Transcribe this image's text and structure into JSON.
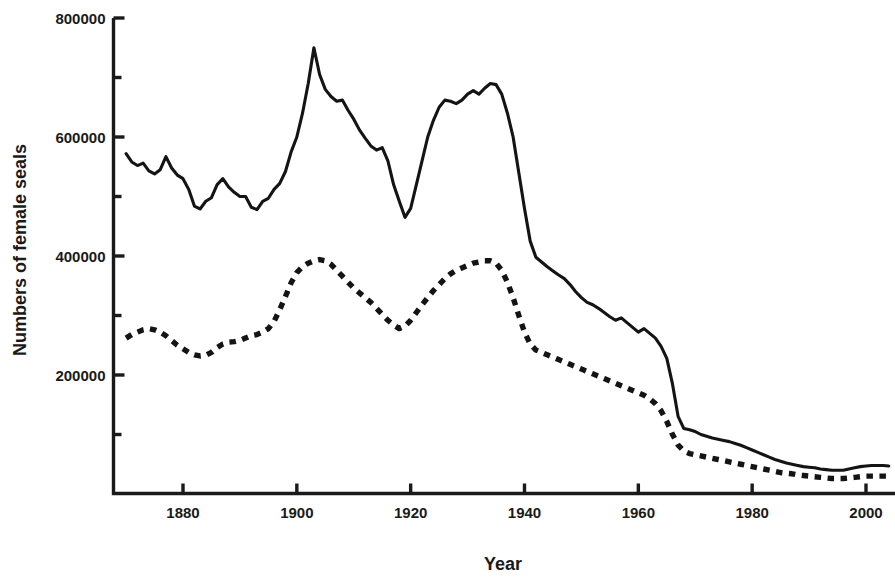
{
  "chart_data": {
    "type": "line",
    "title": "",
    "xlabel": "Year",
    "ylabel": "Numbers of female seals",
    "xlim": [
      1870,
      2005
    ],
    "ylim": [
      0,
      800000
    ],
    "grid": false,
    "legend": "none",
    "x_ticks": [
      1880,
      1900,
      1920,
      1940,
      1960,
      1980,
      2000
    ],
    "x_tick_labels": [
      "1880",
      "1900",
      "1920",
      "1940",
      "1960",
      "1980",
      "2000"
    ],
    "x_minor_ticks": [
      1890,
      1910,
      1930,
      1950,
      1970,
      1990
    ],
    "y_ticks": [
      200000,
      400000,
      600000,
      800000
    ],
    "y_tick_labels": [
      "200000",
      "400000",
      "600000",
      "800000"
    ],
    "y_minor_ticks": [
      100000,
      300000,
      500000,
      700000
    ],
    "series": [
      {
        "name": "solid-line",
        "style": "solid",
        "color": "#141414",
        "x": [
          1870,
          1871,
          1872,
          1873,
          1874,
          1875,
          1876,
          1877,
          1878,
          1879,
          1880,
          1881,
          1882,
          1883,
          1884,
          1885,
          1886,
          1887,
          1888,
          1889,
          1890,
          1891,
          1892,
          1893,
          1894,
          1895,
          1896,
          1897,
          1898,
          1899,
          1900,
          1901,
          1902,
          1903,
          1904,
          1905,
          1906,
          1907,
          1908,
          1909,
          1910,
          1911,
          1912,
          1913,
          1914,
          1915,
          1916,
          1917,
          1918,
          1919,
          1920,
          1921,
          1922,
          1923,
          1924,
          1925,
          1926,
          1927,
          1928,
          1929,
          1930,
          1931,
          1932,
          1933,
          1934,
          1935,
          1936,
          1937,
          1938,
          1939,
          1940,
          1941,
          1942,
          1943,
          1944,
          1945,
          1946,
          1947,
          1948,
          1949,
          1950,
          1951,
          1952,
          1953,
          1954,
          1955,
          1956,
          1957,
          1958,
          1959,
          1960,
          1961,
          1962,
          1963,
          1964,
          1965,
          1966,
          1967,
          1968,
          1969,
          1970,
          1971,
          1972,
          1973,
          1974,
          1975,
          1976,
          1977,
          1978,
          1979,
          1980,
          1981,
          1982,
          1983,
          1984,
          1985,
          1986,
          1987,
          1988,
          1989,
          1990,
          1991,
          1992,
          1993,
          1994,
          1995,
          1996,
          1997,
          1998,
          1999,
          2000,
          2001,
          2002,
          2003,
          2004
        ],
        "y": [
          572000,
          558000,
          552000,
          556000,
          543000,
          538000,
          545000,
          567000,
          548000,
          536000,
          530000,
          512000,
          484000,
          479000,
          492000,
          498000,
          520000,
          530000,
          516000,
          507000,
          500000,
          500000,
          482000,
          478000,
          492000,
          497000,
          512000,
          522000,
          542000,
          575000,
          600000,
          640000,
          690000,
          750000,
          705000,
          680000,
          668000,
          660000,
          662000,
          645000,
          630000,
          612000,
          598000,
          585000,
          578000,
          582000,
          560000,
          520000,
          492000,
          465000,
          480000,
          520000,
          560000,
          600000,
          628000,
          650000,
          662000,
          660000,
          656000,
          662000,
          672000,
          678000,
          672000,
          682000,
          690000,
          688000,
          672000,
          640000,
          600000,
          540000,
          480000,
          425000,
          398000,
          390000,
          382000,
          375000,
          368000,
          362000,
          352000,
          340000,
          330000,
          322000,
          318000,
          312000,
          305000,
          298000,
          292000,
          296000,
          288000,
          280000,
          272000,
          278000,
          270000,
          262000,
          248000,
          228000,
          185000,
          130000,
          110000,
          108000,
          105000,
          100000,
          97000,
          94000,
          92000,
          90000,
          88000,
          85000,
          82000,
          78000,
          74000,
          70000,
          66000,
          62000,
          58000,
          55000,
          52000,
          50000,
          48000,
          46000,
          45000,
          44000,
          42000,
          41000,
          40000,
          40000,
          40000,
          42000,
          44000,
          46000,
          47000,
          48000,
          48000,
          48000,
          47000
        ]
      },
      {
        "name": "dashed-line",
        "style": "dashed",
        "color": "#141414",
        "x": [
          1870,
          1871,
          1872,
          1873,
          1874,
          1875,
          1876,
          1877,
          1878,
          1879,
          1880,
          1881,
          1882,
          1883,
          1884,
          1885,
          1886,
          1887,
          1888,
          1889,
          1890,
          1891,
          1892,
          1893,
          1894,
          1895,
          1896,
          1897,
          1898,
          1899,
          1900,
          1901,
          1902,
          1903,
          1904,
          1905,
          1906,
          1907,
          1908,
          1909,
          1910,
          1911,
          1912,
          1913,
          1914,
          1915,
          1916,
          1917,
          1918,
          1919,
          1920,
          1921,
          1922,
          1923,
          1924,
          1925,
          1926,
          1927,
          1928,
          1929,
          1930,
          1931,
          1932,
          1933,
          1934,
          1935,
          1936,
          1937,
          1938,
          1939,
          1940,
          1941,
          1942,
          1943,
          1944,
          1945,
          1946,
          1947,
          1948,
          1949,
          1950,
          1951,
          1952,
          1953,
          1954,
          1955,
          1956,
          1957,
          1958,
          1959,
          1960,
          1961,
          1962,
          1963,
          1964,
          1965,
          1966,
          1967,
          1968,
          1969,
          1970,
          1971,
          1972,
          1973,
          1974,
          1975,
          1976,
          1977,
          1978,
          1979,
          1980,
          1981,
          1982,
          1983,
          1984,
          1985,
          1986,
          1987,
          1988,
          1989,
          1990,
          1991,
          1992,
          1993,
          1994,
          1995,
          1996,
          1997,
          1998,
          1999,
          2000,
          2001,
          2002,
          2003,
          2004
        ],
        "y": [
          262000,
          268000,
          272000,
          276000,
          278000,
          276000,
          272000,
          266000,
          258000,
          250000,
          244000,
          238000,
          234000,
          232000,
          233000,
          238000,
          246000,
          252000,
          255000,
          256000,
          258000,
          262000,
          266000,
          268000,
          272000,
          278000,
          290000,
          310000,
          332000,
          355000,
          372000,
          382000,
          388000,
          392000,
          394000,
          392000,
          386000,
          376000,
          366000,
          356000,
          346000,
          338000,
          330000,
          322000,
          312000,
          302000,
          292000,
          284000,
          278000,
          282000,
          292000,
          305000,
          318000,
          330000,
          342000,
          352000,
          362000,
          370000,
          376000,
          380000,
          384000,
          388000,
          390000,
          392000,
          392000,
          388000,
          376000,
          356000,
          330000,
          300000,
          272000,
          252000,
          242000,
          238000,
          234000,
          230000,
          226000,
          222000,
          218000,
          214000,
          210000,
          206000,
          202000,
          198000,
          194000,
          190000,
          186000,
          182000,
          178000,
          174000,
          170000,
          166000,
          160000,
          152000,
          140000,
          122000,
          100000,
          82000,
          72000,
          68000,
          66000,
          64000,
          62000,
          60000,
          58000,
          56000,
          54000,
          52000,
          50000,
          48000,
          46000,
          44000,
          42000,
          40000,
          38000,
          36000,
          35000,
          34000,
          32000,
          31000,
          30000,
          29000,
          28000,
          27000,
          26000,
          26000,
          26000,
          27000,
          28000,
          29000,
          30000,
          30000,
          30000,
          30000,
          30000
        ]
      }
    ]
  },
  "labels": {
    "y_axis_title": "Numbers of female seals",
    "x_axis_title": "Year"
  }
}
